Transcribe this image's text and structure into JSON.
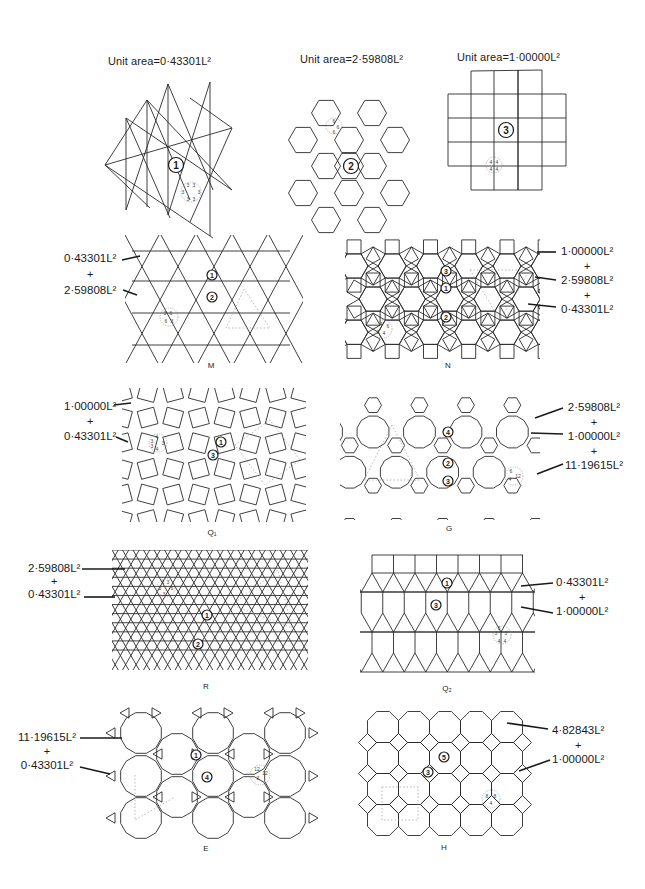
{
  "regular_tilings": [
    {
      "id": "triangle",
      "title": "Unit area=0·43301L²",
      "marker": "1",
      "vertex_config": [
        "3",
        "3",
        "3",
        "3",
        "3",
        "3"
      ]
    },
    {
      "id": "hexagon",
      "title": "Unit area=2·59808L²",
      "marker": "2",
      "vertex_config": [
        "6",
        "6",
        "6"
      ]
    },
    {
      "id": "square",
      "title": "Unit area=1·00000L²",
      "marker": "3",
      "vertex_config": [
        "4",
        "4",
        "4",
        "4"
      ]
    }
  ],
  "semiregular_tilings": [
    {
      "id": "M",
      "caption": "M",
      "areas": [
        "0·43301L²",
        "2·59808L²"
      ],
      "plus": "+",
      "markers": [
        "1",
        "2"
      ],
      "vertex_config": [
        "3",
        "6",
        "6",
        "3"
      ]
    },
    {
      "id": "N",
      "caption": "N",
      "areas": [
        "1·00000L²",
        "2·59808L²",
        "0·43301L²"
      ],
      "plus": "+",
      "markers": [
        "3",
        "1",
        "2"
      ],
      "vertex_config": [
        "4",
        "6",
        "3",
        "4"
      ]
    },
    {
      "id": "Q1",
      "caption": "Q₁",
      "areas": [
        "1·00000L²",
        "0·43301L²"
      ],
      "plus": "+",
      "markers": [
        "1",
        "3"
      ],
      "vertex_config": [
        "3",
        "4",
        "3",
        "4",
        "3"
      ]
    },
    {
      "id": "G",
      "caption": "G",
      "areas": [
        "2·59808L²",
        "1·00000L²",
        "11·19615L²"
      ],
      "plus": "+",
      "markers": [
        "4",
        "2",
        "3"
      ],
      "vertex_config": [
        "6",
        "4",
        "12"
      ]
    },
    {
      "id": "R",
      "caption": "R",
      "areas": [
        "2·59808L²",
        "0·43301L²"
      ],
      "plus": "+",
      "markers": [
        "1",
        "2"
      ],
      "vertex_config": [
        "3",
        "3",
        "3",
        "3",
        "6"
      ]
    },
    {
      "id": "Q2",
      "caption": "Q₂",
      "areas": [
        "0·43301L²",
        "1·00000L²"
      ],
      "plus": "+",
      "markers": [
        "1",
        "3"
      ],
      "vertex_config": [
        "3",
        "3",
        "3",
        "4",
        "4"
      ]
    },
    {
      "id": "E",
      "caption": "E",
      "areas": [
        "11·19615L²",
        "0·43301L²"
      ],
      "plus": "+",
      "markers": [
        "1",
        "4"
      ],
      "vertex_config": [
        "12",
        "12",
        "3"
      ]
    },
    {
      "id": "H",
      "caption": "H",
      "areas": [
        "4·82843L²",
        "1·00000L²"
      ],
      "plus": "+",
      "markers": [
        "5",
        "3"
      ],
      "vertex_config": [
        "8",
        "8",
        "4"
      ]
    }
  ]
}
